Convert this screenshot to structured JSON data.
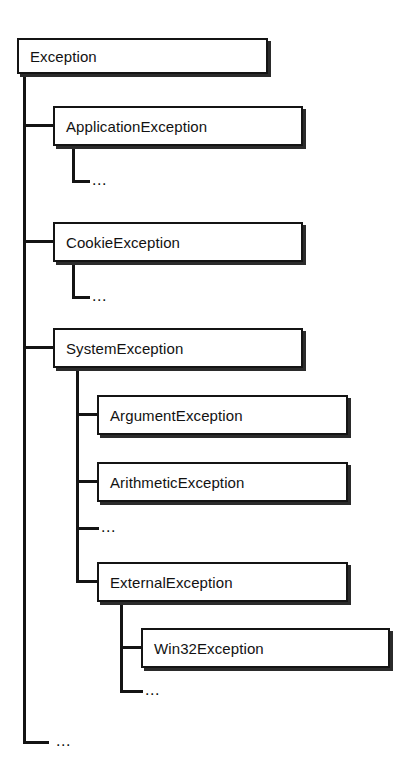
{
  "diagram": {
    "type": "tree",
    "line_color": "#141414",
    "box_border_color": "#141414",
    "background_color": "#ffffff",
    "text_color": "#121212",
    "ellipsis_text": "...",
    "nodes": [
      {
        "id": "exception",
        "label": "Exception",
        "level": 0,
        "x": 17,
        "y": 38,
        "w": 251,
        "h": 36
      },
      {
        "id": "application-exception",
        "label": "ApplicationException",
        "level": 1,
        "x": 53,
        "y": 106,
        "w": 250,
        "h": 40
      },
      {
        "id": "cookie-exception",
        "label": "CookieException",
        "level": 1,
        "x": 53,
        "y": 222,
        "w": 250,
        "h": 40
      },
      {
        "id": "system-exception",
        "label": "SystemException",
        "level": 1,
        "x": 53,
        "y": 328,
        "w": 250,
        "h": 40
      },
      {
        "id": "argument-exception",
        "label": "ArgumentException",
        "level": 2,
        "x": 97,
        "y": 395,
        "w": 251,
        "h": 40
      },
      {
        "id": "arithmetic-exception",
        "label": "ArithmeticException",
        "level": 2,
        "x": 97,
        "y": 462,
        "w": 251,
        "h": 40
      },
      {
        "id": "external-exception",
        "label": "ExternalException",
        "level": 2,
        "x": 97,
        "y": 562,
        "w": 251,
        "h": 40
      },
      {
        "id": "win32-exception",
        "label": "Win32Exception",
        "level": 3,
        "x": 141,
        "y": 628,
        "w": 249,
        "h": 40
      }
    ],
    "ellipsis_nodes": [
      {
        "id": "ellipsis-application-exception",
        "label": "...",
        "parent": "application-exception",
        "x": 92,
        "y": 174
      },
      {
        "id": "ellipsis-cookie-exception",
        "label": "...",
        "parent": "cookie-exception",
        "x": 92,
        "y": 290
      },
      {
        "id": "ellipsis-system-exception",
        "label": "...",
        "parent": "system-exception",
        "x": 101,
        "y": 520
      },
      {
        "id": "ellipsis-external-exception",
        "label": "...",
        "parent": "external-exception",
        "x": 145,
        "y": 684
      },
      {
        "id": "ellipsis-exception",
        "label": "...",
        "parent": "exception",
        "x": 56,
        "y": 734
      }
    ]
  }
}
